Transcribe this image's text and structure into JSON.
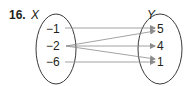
{
  "problem": {
    "number": "16.",
    "domain_label": "X",
    "range_label": "Y"
  },
  "domain_values": [
    "−1",
    "−2",
    "−6"
  ],
  "range_values": [
    "5",
    "4",
    "1"
  ],
  "mappings": [
    {
      "from": "−1",
      "to": "5"
    },
    {
      "from": "−2",
      "to": "5"
    },
    {
      "from": "−2",
      "to": "4"
    },
    {
      "from": "−2",
      "to": "1"
    },
    {
      "from": "−6",
      "to": "1"
    }
  ],
  "colors": {
    "text": "#231f20",
    "ellipse": "#3a3a3a",
    "arrow": "#8c8c8c"
  }
}
